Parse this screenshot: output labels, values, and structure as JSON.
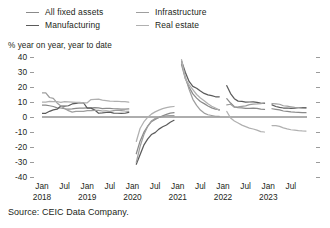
{
  "legend": {
    "items": [
      {
        "label": "All fixed assets",
        "color": "#8a8a8a"
      },
      {
        "label": "Infrastructure",
        "color": "#9e9e9e"
      },
      {
        "label": "Manufacturing",
        "color": "#5b5b5b"
      },
      {
        "label": "Real estate",
        "color": "#b0b0b0"
      }
    ]
  },
  "axis_note": "% year on year, year to date",
  "source": "Source: CEIC Data Company.",
  "chart_data": {
    "type": "line",
    "title": "",
    "subtitle": "",
    "xlabel": "",
    "ylabel": "% year on year, year to date",
    "ylim": [
      -40,
      40
    ],
    "yticks": [
      40,
      30,
      20,
      10,
      0,
      -10,
      -20,
      -30,
      -40
    ],
    "ytick_labels": [
      "40",
      "30",
      "20",
      "10",
      "0",
      "-10",
      "-20",
      "-30",
      "-40"
    ],
    "grid": false,
    "zero_line": true,
    "legend_position": "top",
    "x_tick_months": [
      "Jan",
      "Jul",
      "Jan",
      "Jul",
      "Jan",
      "Jul",
      "Jan",
      "Jul",
      "Jan",
      "Jul",
      "Jan",
      "Jul"
    ],
    "x_tick_years": [
      "2018",
      "",
      "2019",
      "",
      "2020",
      "",
      "2021",
      "",
      "2022",
      "",
      "2023",
      ""
    ],
    "x_start": "2018-01",
    "x_end": "2023-11",
    "x_months": [
      "2018-01",
      "2018-02",
      "2018-03",
      "2018-04",
      "2018-05",
      "2018-06",
      "2018-07",
      "2018-08",
      "2018-09",
      "2018-10",
      "2018-11",
      "2018-12",
      "2019-01",
      "2019-02",
      "2019-03",
      "2019-04",
      "2019-05",
      "2019-06",
      "2019-07",
      "2019-08",
      "2019-09",
      "2019-10",
      "2019-11",
      "2019-12",
      "2020-01",
      "2020-02",
      "2020-03",
      "2020-04",
      "2020-05",
      "2020-06",
      "2020-07",
      "2020-08",
      "2020-09",
      "2020-10",
      "2020-11",
      "2020-12",
      "2021-01",
      "2021-02",
      "2021-03",
      "2021-04",
      "2021-05",
      "2021-06",
      "2021-07",
      "2021-08",
      "2021-09",
      "2021-10",
      "2021-11",
      "2021-12",
      "2022-01",
      "2022-02",
      "2022-03",
      "2022-04",
      "2022-05",
      "2022-06",
      "2022-07",
      "2022-08",
      "2022-09",
      "2022-10",
      "2022-11",
      "2022-12",
      "2023-01",
      "2023-02",
      "2023-03",
      "2023-04",
      "2023-05",
      "2023-06",
      "2023-07",
      "2023-08",
      "2023-09",
      "2023-10",
      "2023-11"
    ],
    "series": [
      {
        "name": "All fixed assets",
        "color": "#8a8a8a",
        "values": [
          7.9,
          7.9,
          7.5,
          7.0,
          6.1,
          6.0,
          5.5,
          5.3,
          5.4,
          5.7,
          5.9,
          5.9,
          6.1,
          6.1,
          6.3,
          6.1,
          5.6,
          5.8,
          5.7,
          5.5,
          5.4,
          5.2,
          5.2,
          5.4,
          null,
          -24.5,
          -16.1,
          -10.3,
          -6.3,
          -3.1,
          -1.6,
          -0.3,
          0.8,
          1.8,
          2.6,
          2.9,
          null,
          35.0,
          25.6,
          19.9,
          15.4,
          12.6,
          10.3,
          8.9,
          7.3,
          6.1,
          5.2,
          4.9,
          null,
          12.2,
          9.3,
          6.8,
          6.2,
          6.1,
          5.7,
          5.8,
          5.9,
          5.8,
          5.3,
          5.1,
          null,
          5.5,
          5.1,
          4.7,
          4.0,
          3.8,
          3.4,
          3.2,
          3.1,
          2.9,
          2.9
        ]
      },
      {
        "name": "Manufacturing",
        "color": "#5b5b5b",
        "values": [
          2.5,
          2.5,
          3.8,
          4.8,
          5.2,
          7.3,
          7.3,
          7.5,
          8.7,
          9.1,
          9.5,
          9.5,
          5.9,
          5.9,
          4.6,
          2.5,
          2.7,
          3.0,
          3.3,
          2.6,
          2.5,
          2.4,
          2.5,
          3.1,
          null,
          -31.5,
          -25.2,
          -18.8,
          -14.8,
          -11.7,
          -10.4,
          -8.1,
          -6.5,
          -5.3,
          -3.5,
          -2.2,
          null,
          37.3,
          29.8,
          23.7,
          20.4,
          19.2,
          17.3,
          15.7,
          14.8,
          14.2,
          13.5,
          13.5,
          null,
          20.9,
          15.6,
          12.2,
          10.6,
          10.4,
          9.9,
          10.0,
          10.1,
          9.7,
          9.3,
          9.1,
          null,
          8.1,
          7.0,
          6.4,
          6.0,
          6.0,
          5.7,
          5.9,
          6.2,
          6.2,
          6.3
        ]
      },
      {
        "name": "Infrastructure",
        "color": "#9e9e9e",
        "values": [
          16.1,
          16.1,
          13.0,
          12.4,
          9.4,
          7.3,
          5.7,
          4.2,
          3.3,
          3.7,
          3.7,
          3.8,
          4.3,
          4.3,
          4.4,
          4.4,
          4.0,
          4.1,
          3.8,
          4.2,
          4.5,
          4.3,
          4.0,
          3.8,
          null,
          -30.3,
          -19.7,
          -11.8,
          -6.3,
          -2.7,
          -1.0,
          -0.3,
          0.2,
          0.7,
          0.9,
          0.9,
          null,
          36.6,
          26.8,
          18.4,
          11.8,
          7.8,
          4.6,
          2.6,
          1.5,
          1.0,
          0.5,
          0.4,
          null,
          8.1,
          8.5,
          6.5,
          6.7,
          7.1,
          7.4,
          8.3,
          8.6,
          8.7,
          8.9,
          9.4,
          null,
          9.0,
          8.8,
          8.5,
          7.5,
          7.2,
          6.8,
          6.4,
          6.2,
          5.9,
          5.8
        ]
      },
      {
        "name": "Real estate",
        "color": "#b0b0b0",
        "values": [
          9.9,
          9.9,
          10.4,
          10.2,
          10.2,
          9.7,
          10.2,
          10.1,
          9.9,
          9.7,
          9.7,
          9.5,
          9.5,
          11.6,
          11.8,
          11.9,
          11.2,
          10.9,
          10.6,
          10.5,
          10.5,
          10.3,
          10.2,
          9.9,
          null,
          -16.3,
          -7.7,
          -3.3,
          -0.3,
          1.9,
          3.4,
          4.6,
          5.6,
          6.3,
          6.8,
          7.0,
          null,
          38.3,
          25.6,
          21.6,
          18.3,
          15.0,
          12.7,
          10.9,
          8.8,
          7.2,
          6.0,
          4.4,
          null,
          3.7,
          -0.7,
          -2.7,
          -4.0,
          -5.4,
          -6.4,
          -7.4,
          -8.0,
          -8.8,
          -9.8,
          -10.0,
          null,
          -5.7,
          -5.8,
          -6.2,
          -7.2,
          -7.9,
          -8.5,
          -8.8,
          -9.1,
          -9.3,
          -9.4
        ]
      }
    ]
  }
}
